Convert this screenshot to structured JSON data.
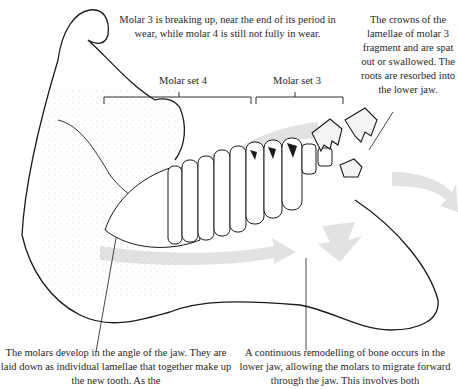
{
  "figure": {
    "labels": {
      "molar_set_4": "Molar set 4",
      "molar_set_3": "Molar set 3"
    },
    "captions": {
      "top_center": "Molar 3 is breaking up, near the end of its period in wear, while molar 4 is still not fully in wear.",
      "top_right": "The crowns of the lamellae of molar 3 fragment and are spat out or swallowed. The roots are resorbed into the lower jaw.",
      "bottom_left": "The molars develop in the angle of the jaw. They are laid down as individual lamellae that together make up the new tooth. As the",
      "bottom_right": "A continuous remodelling of bone occurs in the lower jaw, allowing the molars to migrate forward through the jaw. This involves both"
    },
    "colors": {
      "arrow": "#e2e2e2",
      "line": "#1a1a1a",
      "stipple": "#9a9a9a"
    }
  }
}
